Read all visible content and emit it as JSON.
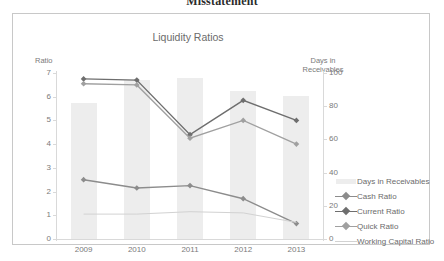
{
  "document": {
    "heading": "Misstatement"
  },
  "chart_data": {
    "type": "line",
    "title": "Liquidity Ratios",
    "categories": [
      "2009",
      "2010",
      "2011",
      "2012",
      "2013"
    ],
    "xlabel": "",
    "left_axis": {
      "label": "Ratio",
      "ticks": [
        "0",
        "1",
        "2",
        "3",
        "4",
        "5",
        "6",
        "7"
      ],
      "ylim": [
        0,
        7
      ]
    },
    "right_axis": {
      "label": "Days in Receivables",
      "label_line1": "Days in",
      "label_line2": "Receivables",
      "ticks": [
        "0",
        "20",
        "40",
        "60",
        "80",
        "100"
      ],
      "ylim": [
        0,
        100
      ]
    },
    "grid": false,
    "legend_position": "right",
    "series": [
      {
        "name": "Days in Receivables",
        "kind": "bar",
        "axis": "right",
        "color": "#ededed",
        "values": [
          82,
          96,
          97,
          89,
          86
        ]
      },
      {
        "name": "Cash Ratio",
        "kind": "line",
        "axis": "left",
        "color": "#8c8c8c",
        "values": [
          2.5,
          2.15,
          2.25,
          1.7,
          0.65
        ]
      },
      {
        "name": "Current Ratio",
        "kind": "line",
        "axis": "left",
        "color": "#6e6e6e",
        "values": [
          6.75,
          6.7,
          4.4,
          5.85,
          5.0
        ]
      },
      {
        "name": "Quick Ratio",
        "kind": "line",
        "axis": "left",
        "color": "#a0a0a0",
        "values": [
          6.55,
          6.5,
          4.25,
          5.0,
          4.0
        ]
      },
      {
        "name": "Working Capital Ratio",
        "kind": "line",
        "axis": "left",
        "color": "#d2d2d2",
        "values": [
          1.05,
          1.05,
          1.15,
          1.1,
          0.7
        ]
      }
    ]
  }
}
